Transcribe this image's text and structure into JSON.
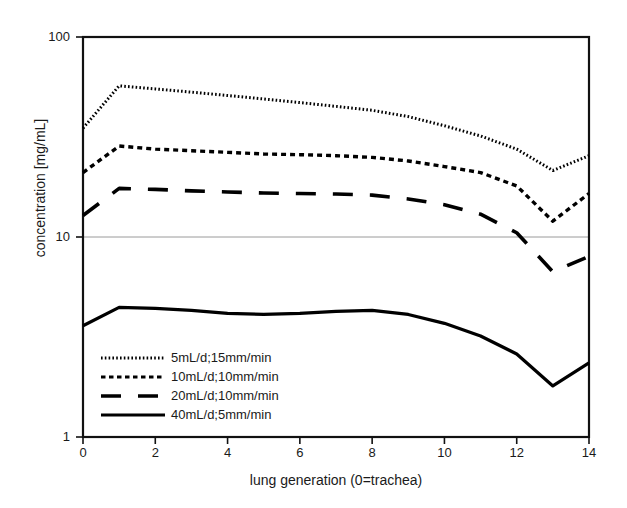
{
  "chart_data": {
    "type": "line",
    "title": "",
    "xlabel": "lung generation (0=trachea)",
    "ylabel": "concentration [mg/mL]",
    "xlim": [
      0,
      14
    ],
    "ylim": [
      1,
      100
    ],
    "yscale": "log",
    "xscale": "linear",
    "grid": "horizontal gridline at y=10 only",
    "legend_position": "lower-left inside axes",
    "xticks": [
      "0",
      "2",
      "4",
      "6",
      "8",
      "10",
      "12",
      "14"
    ],
    "xtick_values": [
      0,
      2,
      4,
      6,
      8,
      10,
      12,
      14
    ],
    "yticks": [
      "1",
      "10",
      "100"
    ],
    "ytick_values": [
      1,
      10,
      100
    ],
    "x": [
      0,
      1,
      2,
      3,
      4,
      5,
      6,
      7,
      8,
      9,
      10,
      11,
      12,
      13,
      14
    ],
    "series": [
      {
        "name": "5mL/d;15mm/min",
        "style": "dotted",
        "color": "#000000",
        "values": [
          35.0,
          57.0,
          55.0,
          53.0,
          51.0,
          49.0,
          47.0,
          45.0,
          43.0,
          40.0,
          36.0,
          32.0,
          27.5,
          21.5,
          25.5
        ]
      },
      {
        "name": "10mL/d;10mm/min",
        "style": "dashed",
        "color": "#000000",
        "values": [
          21.0,
          28.5,
          27.5,
          27.0,
          26.5,
          26.0,
          25.8,
          25.5,
          25.0,
          24.0,
          22.5,
          21.0,
          18.0,
          12.0,
          16.5
        ]
      },
      {
        "name": "20mL/d;10mm/min",
        "style": "long-dash",
        "color": "#000000",
        "values": [
          12.8,
          17.5,
          17.3,
          17.0,
          16.8,
          16.6,
          16.5,
          16.4,
          16.2,
          15.5,
          14.5,
          13.0,
          10.5,
          6.7,
          8.0
        ]
      },
      {
        "name": "40mL/d;5mm/min",
        "style": "solid",
        "color": "#000000",
        "values": [
          3.6,
          4.45,
          4.4,
          4.3,
          4.15,
          4.1,
          4.15,
          4.25,
          4.3,
          4.1,
          3.7,
          3.2,
          2.6,
          1.8,
          2.35
        ]
      }
    ]
  },
  "axes": {
    "ytick_labels": [
      "100",
      "10",
      "1"
    ],
    "xtick_labels": [
      "0",
      "2",
      "4",
      "6",
      "8",
      "10",
      "12",
      "14"
    ],
    "x_axis_title": "lung generation (0=trachea)",
    "y_axis_title": "concentration [mg/mL]"
  },
  "legend": {
    "items": [
      {
        "label": "5mL/d;15mm/min",
        "style": "dotted"
      },
      {
        "label": "10mL/d;10mm/min",
        "style": "dashed"
      },
      {
        "label": "20mL/d;10mm/min",
        "style": "long-dash"
      },
      {
        "label": "40mL/d;5mm/min",
        "style": "solid"
      }
    ]
  },
  "colors": {
    "line": "#000000",
    "frame": "#111111",
    "gridline": "#9a9a9a",
    "background": "#ffffff"
  }
}
